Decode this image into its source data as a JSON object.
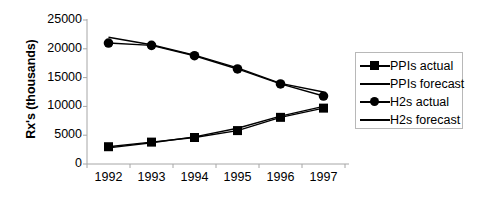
{
  "chart_data": {
    "type": "line",
    "title": "",
    "xlabel": "",
    "ylabel": "Rx's (thousands)",
    "categories": [
      "1992",
      "1993",
      "1994",
      "1995",
      "1996",
      "1997"
    ],
    "x": [
      1992,
      1993,
      1994,
      1995,
      1996,
      1997
    ],
    "ylim": [
      0,
      25000
    ],
    "xlim": [
      1991.5,
      1997.5
    ],
    "yticks": [
      0,
      5000,
      10000,
      15000,
      20000,
      25000
    ],
    "ytick_labels": [
      "0",
      "5000",
      "10000",
      "15000",
      "20000",
      "25000"
    ],
    "xtick_labels": [
      "1992",
      "1993",
      "1994",
      "1995",
      "1996",
      "1997"
    ],
    "grid": false,
    "legend_position": "right",
    "series": [
      {
        "name": "PPIs actual",
        "marker": "square",
        "values": [
          3000,
          3800,
          4600,
          5800,
          8100,
          9700
        ]
      },
      {
        "name": "PPIs forecast",
        "marker": "none",
        "values": [
          2800,
          3700,
          4700,
          6200,
          8300,
          10000
        ]
      },
      {
        "name": "H2s actual",
        "marker": "circle",
        "values": [
          21000,
          20600,
          18800,
          16500,
          13900,
          11800
        ]
      },
      {
        "name": "H2s forecast",
        "marker": "none",
        "values": [
          22000,
          20700,
          18900,
          16700,
          14000,
          12500
        ]
      }
    ]
  },
  "legend": {
    "items": [
      {
        "label": "PPIs actual",
        "key": "line-with-square-marker"
      },
      {
        "label": "PPIs forecast",
        "key": "line"
      },
      {
        "label": "H2s actual",
        "key": "line-with-circle-marker"
      },
      {
        "label": "H2s forecast",
        "key": "line"
      }
    ]
  },
  "axes": {
    "y_title": "Rx's (thousands)",
    "y_labels": [
      "25000",
      "20000",
      "15000",
      "10000",
      "5000",
      "0"
    ],
    "x_labels": [
      "1992",
      "1993",
      "1994",
      "1995",
      "1996",
      "1997"
    ]
  },
  "colors": {
    "series_line": "#000000",
    "axis": "#a6a6a6",
    "legend_border": "#b8b8b8",
    "background": "#ffffff",
    "text": "#000000"
  }
}
